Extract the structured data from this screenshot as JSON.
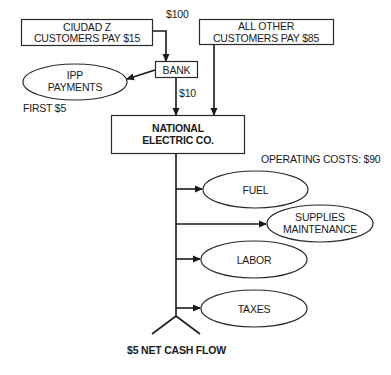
{
  "diagram": {
    "nodes": {
      "ciudad_z": {
        "line1": "CIUDAD Z",
        "line2": "CUSTOMERS PAY $15",
        "shape": "rect"
      },
      "all_other": {
        "line1": "ALL OTHER",
        "line2": "CUSTOMERS PAY $85",
        "shape": "rect"
      },
      "bank": {
        "label": "BANK",
        "shape": "rect"
      },
      "ipp": {
        "line1": "IPP",
        "line2": "PAYMENTS",
        "shape": "ellipse"
      },
      "national": {
        "line1": "NATIONAL",
        "line2": "ELECTRIC CO.",
        "shape": "rect"
      },
      "fuel": {
        "label": "FUEL",
        "shape": "ellipse"
      },
      "supplies": {
        "line1": "SUPPLIES",
        "line2": "MAINTENANCE",
        "shape": "ellipse"
      },
      "labor": {
        "label": "LABOR",
        "shape": "ellipse"
      },
      "taxes": {
        "label": "TAXES",
        "shape": "ellipse"
      }
    },
    "annotations": {
      "ciudad_to_bank": "$100",
      "bank_to_national": "$10",
      "ipp_first": "FIRST $5",
      "operating_costs": "OPERATING COSTS: $90",
      "net_cash_flow": "$5 NET CASH FLOW"
    },
    "edges": [
      {
        "from": "ciudad_z",
        "to": "bank",
        "label": "$100"
      },
      {
        "from": "bank",
        "to": "ipp",
        "label": "FIRST $5"
      },
      {
        "from": "bank",
        "to": "national",
        "label": "$10"
      },
      {
        "from": "all_other",
        "to": "national",
        "label": ""
      },
      {
        "from": "national",
        "to": "fuel",
        "label": ""
      },
      {
        "from": "national",
        "to": "supplies",
        "label": ""
      },
      {
        "from": "national",
        "to": "labor",
        "label": ""
      },
      {
        "from": "national",
        "to": "taxes",
        "label": ""
      }
    ]
  }
}
